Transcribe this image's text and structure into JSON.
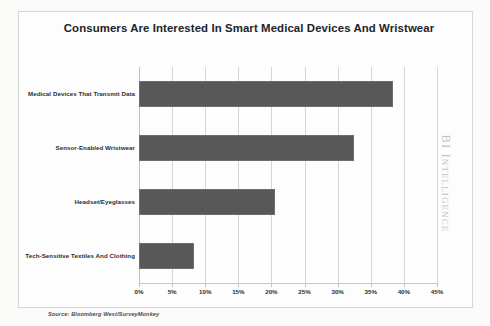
{
  "chart_data": {
    "type": "bar",
    "orientation": "horizontal",
    "title": "Consumers Are Interested In Smart Medical Devices And Wristwear",
    "categories": [
      "Medical Devices That Transmit Data",
      "Sensor-Enabled Wristwear",
      "Headset/Eyeglasses",
      "Tech-Sensitive Textiles And Clothing"
    ],
    "values": [
      38.3,
      32.4,
      20.5,
      8.3
    ],
    "xlabel": "",
    "ylabel": "",
    "xlim": [
      0,
      45
    ],
    "x_tick_labels": [
      "0%",
      "5%",
      "10%",
      "15%",
      "20%",
      "25%",
      "30%",
      "35%",
      "40%",
      "45%"
    ],
    "x_tick_values": [
      0,
      5,
      10,
      15,
      20,
      25,
      30,
      35,
      40,
      45
    ],
    "grid": true,
    "grid_axis": "x",
    "legend": false,
    "bar_color": "#585858",
    "gridline_color": "#d5d5d5",
    "title_color": "#20242b"
  },
  "source_note": "Source: Bloomberg West/SurveyMonkey",
  "watermark": {
    "text": "BI Intelligence",
    "color": "#c3c3c3"
  }
}
